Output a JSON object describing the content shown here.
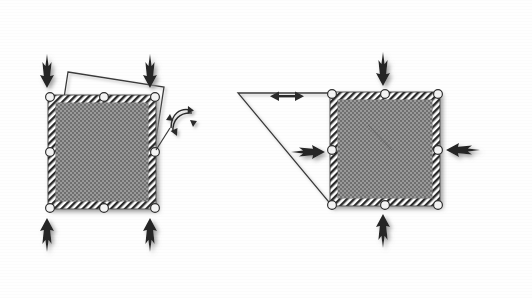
{
  "figure": {
    "background_color": "#fefefe",
    "ink_color": "#2b2b2b",
    "fill_color": "#8a8a8a",
    "handle_color": "#f2f2f2",
    "panels": [
      {
        "id": "left-panel",
        "name": "rotation-panel",
        "caption": "",
        "element": {
          "name": "hatched-square",
          "x": 48,
          "y": 95,
          "width": 108,
          "height": 114,
          "fill": "#8a8a8a",
          "border_style": "diagonal-hatch"
        },
        "deformed_outline": {
          "name": "rotated-outline",
          "type": "rotated-square",
          "rotation_degrees": -8,
          "points": "68,72 162,86 146,196 52,182"
        },
        "handles": [
          {
            "name": "handle-top-left",
            "cx": 50,
            "cy": 97,
            "shape": "circle"
          },
          {
            "name": "handle-top-center",
            "cx": 104,
            "cy": 97,
            "shape": "circle"
          },
          {
            "name": "handle-top-right",
            "cx": 155,
            "cy": 97,
            "shape": "circle"
          },
          {
            "name": "handle-middle-left",
            "cx": 50,
            "cy": 152,
            "shape": "circle"
          },
          {
            "name": "handle-middle-right",
            "cx": 155,
            "cy": 152,
            "shape": "circle"
          },
          {
            "name": "handle-bottom-left",
            "cx": 50,
            "cy": 208,
            "shape": "circle"
          },
          {
            "name": "handle-bottom-center",
            "cx": 104,
            "cy": 208,
            "shape": "circle"
          },
          {
            "name": "handle-bottom-right",
            "cx": 155,
            "cy": 208,
            "shape": "circle"
          }
        ],
        "arrows": [
          {
            "name": "arrow-top-left-down",
            "direction": "down",
            "tip_x": 47,
            "tip_y": 88,
            "length": 62
          },
          {
            "name": "arrow-top-right-down",
            "direction": "down",
            "tip_x": 150,
            "tip_y": 88,
            "length": 62
          },
          {
            "name": "arrow-bottom-left-up",
            "direction": "up",
            "tip_x": 47,
            "tip_y": 218,
            "length": 62
          },
          {
            "name": "arrow-bottom-right-up",
            "direction": "up",
            "tip_x": 150,
            "tip_y": 218,
            "length": 62
          }
        ],
        "annotation": {
          "name": "rotation-indicator",
          "type": "curved-rotation-arrows",
          "x": 168,
          "y": 112,
          "label": ""
        }
      },
      {
        "id": "right-panel",
        "name": "shear-panel",
        "caption": "",
        "element": {
          "name": "hatched-square",
          "x": 330,
          "y": 92,
          "width": 110,
          "height": 114,
          "fill": "#8a8a8a",
          "border_style": "diagonal-hatch"
        },
        "deformed_outline": {
          "name": "shear-wedge-outline",
          "type": "shear-triangle",
          "points": "238,92 333,92 333,206"
        },
        "handles": [
          {
            "name": "handle-top-left",
            "cx": 332,
            "cy": 94,
            "shape": "circle"
          },
          {
            "name": "handle-top-center",
            "cx": 385,
            "cy": 94,
            "shape": "circle"
          },
          {
            "name": "handle-top-right",
            "cx": 438,
            "cy": 94,
            "shape": "circle"
          },
          {
            "name": "handle-middle-left",
            "cx": 332,
            "cy": 150,
            "shape": "circle"
          },
          {
            "name": "handle-middle-right",
            "cx": 438,
            "cy": 150,
            "shape": "circle"
          },
          {
            "name": "handle-bottom-left",
            "cx": 332,
            "cy": 205,
            "shape": "circle"
          },
          {
            "name": "handle-bottom-center",
            "cx": 385,
            "cy": 205,
            "shape": "circle"
          },
          {
            "name": "handle-bottom-right",
            "cx": 438,
            "cy": 205,
            "shape": "circle"
          }
        ],
        "arrows": [
          {
            "name": "arrow-top-down",
            "direction": "down",
            "tip_x": 383,
            "tip_y": 86,
            "length": 62
          },
          {
            "name": "arrow-bottom-up",
            "direction": "up",
            "tip_x": 383,
            "tip_y": 214,
            "length": 62
          },
          {
            "name": "arrow-left-right",
            "direction": "right",
            "tip_x": 325,
            "tip_y": 152,
            "length": 62
          },
          {
            "name": "arrow-right-left",
            "direction": "left",
            "tip_x": 446,
            "tip_y": 150,
            "length": 62
          }
        ],
        "annotation": {
          "name": "displacement-indicator",
          "type": "double-headed-arrow",
          "x1": 272,
          "x2": 302,
          "y": 96,
          "label": ""
        }
      }
    ]
  }
}
